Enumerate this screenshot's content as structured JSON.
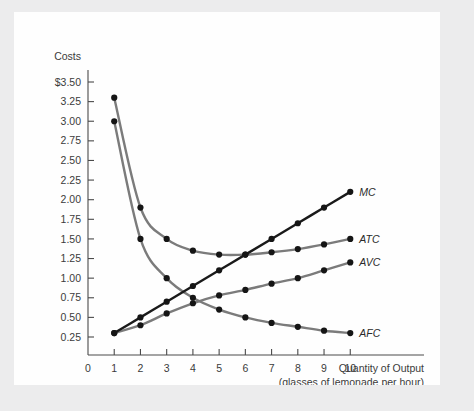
{
  "figure": {
    "background_color": "#ececed",
    "panel_color": "#fefefe"
  },
  "axes": {
    "y_title": "Costs",
    "x_title_line1": "Quantity of Output",
    "x_title_line2": "(glasses of lemonade per hour)",
    "y_tick_labels": [
      "$3.50",
      "3.25",
      "3.00",
      "2.75",
      "2.50",
      "2.25",
      "2.00",
      "1.75",
      "1.50",
      "1.25",
      "1.00",
      "0.75",
      "0.50",
      "0.25"
    ],
    "x_tick_labels": [
      "0",
      "1",
      "2",
      "3",
      "4",
      "5",
      "6",
      "7",
      "8",
      "9",
      "10"
    ],
    "axis_color": "#4a4a4a"
  },
  "chart_data": {
    "type": "line",
    "title": "",
    "xlabel": "Quantity of Output (glasses of lemonade per hour)",
    "ylabel": "Costs",
    "xlim": [
      0,
      10.6
    ],
    "ylim": [
      0,
      3.6
    ],
    "ytick_values": [
      3.5,
      3.25,
      3.0,
      2.75,
      2.5,
      2.25,
      2.0,
      1.75,
      1.5,
      1.25,
      1.0,
      0.75,
      0.5,
      0.25
    ],
    "xtick_values": [
      0,
      1,
      2,
      3,
      4,
      5,
      6,
      7,
      8,
      9,
      10
    ],
    "grid": false,
    "legend_position": "inline-right-of-curve-end",
    "x": [
      1,
      2,
      3,
      4,
      5,
      6,
      7,
      8,
      9,
      10
    ],
    "series": [
      {
        "name": "MC",
        "label": "MC",
        "color": "#1a1a1a",
        "width": 2.4,
        "values": [
          0.3,
          0.5,
          0.7,
          0.9,
          1.1,
          1.3,
          1.5,
          1.7,
          1.9,
          2.1
        ]
      },
      {
        "name": "ATC",
        "label": "ATC",
        "color": "#7b7b7b",
        "width": 2.4,
        "values": [
          3.3,
          1.9,
          1.5,
          1.35,
          1.3,
          1.3,
          1.33,
          1.37,
          1.43,
          1.5
        ]
      },
      {
        "name": "AVC",
        "label": "AVC",
        "color": "#7b7b7b",
        "width": 2.4,
        "values": [
          0.3,
          0.4,
          0.55,
          0.68,
          0.78,
          0.85,
          0.93,
          1.0,
          1.1,
          1.2
        ]
      },
      {
        "name": "AFC",
        "label": "AFC",
        "color": "#7b7b7b",
        "width": 2.4,
        "values": [
          3.0,
          1.5,
          1.0,
          0.75,
          0.6,
          0.5,
          0.43,
          0.38,
          0.33,
          0.3
        ]
      }
    ]
  }
}
